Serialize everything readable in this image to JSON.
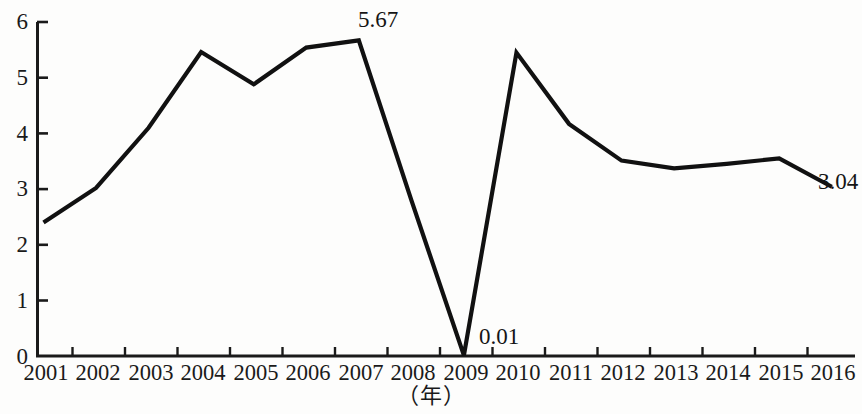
{
  "chart_data": {
    "type": "line",
    "title": "",
    "subtitle": "",
    "xlabel": "（年）",
    "ylabel": "",
    "categories": [
      "2001",
      "2002",
      "2003",
      "2004",
      "2005",
      "2006",
      "2007",
      "2008",
      "2009",
      "2010",
      "2011",
      "2012",
      "2013",
      "2014",
      "2015",
      "2016"
    ],
    "values": [
      2.4,
      3.02,
      4.1,
      5.46,
      4.88,
      5.54,
      5.67,
      2.8,
      0.01,
      5.45,
      4.17,
      3.51,
      3.37,
      3.45,
      3.55,
      3.04
    ],
    "xlim": [
      "2001",
      "2016"
    ],
    "ylim": [
      0,
      6
    ],
    "yticks": [
      0,
      1,
      2,
      3,
      4,
      5,
      6
    ],
    "ytick_labels": [
      "0",
      "1",
      "2",
      "3",
      "4",
      "5",
      "6"
    ],
    "grid": false,
    "legend": null,
    "legend_position": "none",
    "series": [
      {
        "name": "series-1",
        "color": "#111111",
        "values": [
          2.4,
          3.02,
          4.1,
          5.46,
          4.88,
          5.54,
          5.67,
          2.8,
          0.01,
          5.45,
          4.17,
          3.51,
          3.37,
          3.45,
          3.55,
          3.04
        ]
      }
    ],
    "annotations": [
      {
        "id": "peak-2007",
        "text": "5.67",
        "category": "2007",
        "value": 5.67
      },
      {
        "id": "trough-2009",
        "text": "0.01",
        "category": "2009",
        "value": 0.01
      },
      {
        "id": "end-2016",
        "text": "3.04",
        "category": "2016",
        "value": 3.04
      }
    ]
  },
  "axes": {
    "y_title": "",
    "x_title": "（年）"
  },
  "colors": {
    "line": "#111111",
    "axis": "#1a1a1a",
    "background": "#fdfdfc",
    "text": "#1a1a1a"
  }
}
